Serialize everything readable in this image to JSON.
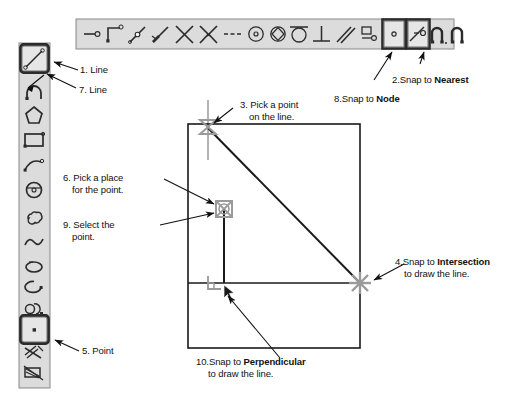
{
  "diagram": {
    "background": "#ffffff",
    "colors": {
      "toolbar_fill": "#d9d9d9",
      "toolbar_stroke": "#6b6b6b",
      "icon_stroke": "#2b2b2b",
      "selected_button_fill": "#e2e2e2",
      "selected_button_stroke": "#3a3a3a",
      "drawing_stroke": "#1a1a1a",
      "snap_marker": "#8a8a8a",
      "crosshair": "#9a9a9a",
      "arrow": "#111111",
      "text": "#111111"
    }
  },
  "top_toolbar": {
    "name": "snap-toolbar",
    "items": [
      {
        "id": "snap-endpoint",
        "icon": "line-endpoint-icon",
        "selected": false
      },
      {
        "id": "snap-corner",
        "icon": "corner-node-icon",
        "selected": false
      },
      {
        "id": "snap-midpoint",
        "icon": "midpoint-icon",
        "selected": false
      },
      {
        "id": "snap-end-of-line",
        "icon": "end-of-line-icon",
        "selected": false
      },
      {
        "id": "snap-intersection",
        "icon": "intersection-x-icon",
        "selected": false
      },
      {
        "id": "snap-apparent-intersection",
        "icon": "apparent-intersection-icon",
        "selected": false
      },
      {
        "id": "snap-extension",
        "icon": "extension-dashes-icon",
        "selected": false
      },
      {
        "id": "snap-center",
        "icon": "center-circle-icon",
        "selected": false
      },
      {
        "id": "snap-quadrant",
        "icon": "quadrant-icon",
        "selected": false
      },
      {
        "id": "snap-tangent",
        "icon": "tangent-icon",
        "selected": false
      },
      {
        "id": "snap-perpendicular",
        "icon": "perpendicular-icon",
        "selected": false
      },
      {
        "id": "snap-parallel",
        "icon": "parallel-icon",
        "selected": false
      },
      {
        "id": "snap-insert",
        "icon": "insert-icon",
        "selected": false
      },
      {
        "id": "snap-node",
        "icon": "node-dot-icon",
        "selected": true
      },
      {
        "id": "snap-nearest",
        "icon": "nearest-icon",
        "selected": true
      },
      {
        "id": "osnap-toggle",
        "icon": "magnet-icon",
        "selected": false
      },
      {
        "id": "osnap-settings",
        "icon": "magnet-settings-icon",
        "selected": false
      }
    ]
  },
  "left_toolbar": {
    "name": "draw-toolbar",
    "items": [
      {
        "id": "draw-line",
        "icon": "line-icon",
        "selected": true
      },
      {
        "id": "draw-polyline",
        "icon": "polyline-arc-icon",
        "selected": false
      },
      {
        "id": "draw-polygon",
        "icon": "polygon-icon",
        "selected": false
      },
      {
        "id": "draw-rectangle",
        "icon": "rectangle-icon",
        "selected": false
      },
      {
        "id": "draw-arc",
        "icon": "arc-icon",
        "selected": false
      },
      {
        "id": "draw-circle",
        "icon": "circle-icon",
        "selected": false
      },
      {
        "id": "draw-revcloud",
        "icon": "revision-cloud-icon",
        "selected": false
      },
      {
        "id": "draw-spline",
        "icon": "spline-icon",
        "selected": false
      },
      {
        "id": "draw-ellipse",
        "icon": "ellipse-icon",
        "selected": false
      },
      {
        "id": "draw-ellipse-arc",
        "icon": "ellipse-arc-icon",
        "selected": false
      },
      {
        "id": "draw-block",
        "icon": "insert-block-icon",
        "selected": false
      },
      {
        "id": "draw-make-block",
        "icon": "make-block-icon",
        "selected": false
      },
      {
        "id": "draw-point",
        "icon": "point-icon",
        "selected": true
      },
      {
        "id": "draw-hatch",
        "icon": "hatch-icon",
        "selected": false
      },
      {
        "id": "draw-gradient",
        "icon": "gradient-icon",
        "selected": false
      }
    ]
  },
  "callouts": [
    {
      "id": "callout-1",
      "number": "1.",
      "line1": "Line",
      "line2": "",
      "bold_word": "",
      "bold_tail": ""
    },
    {
      "id": "callout-7",
      "number": "7.",
      "line1": "Line",
      "line2": "",
      "bold_word": "",
      "bold_tail": ""
    },
    {
      "id": "callout-2",
      "number": "2.",
      "line1": "Snap to ",
      "bold_word": "Nearest",
      "line2": "",
      "bold_tail": ""
    },
    {
      "id": "callout-8",
      "number": "8.",
      "line1": "Snap to ",
      "bold_word": "Node",
      "line2": "",
      "bold_tail": ""
    },
    {
      "id": "callout-3",
      "number": "3.",
      "line1": "Pick a point",
      "line2": "on the line.",
      "bold_word": "",
      "bold_tail": ""
    },
    {
      "id": "callout-6",
      "number": "6.",
      "line1": "Pick a place",
      "line2": "for the point.",
      "bold_word": "",
      "bold_tail": ""
    },
    {
      "id": "callout-9",
      "number": "9.",
      "line1": "Select the",
      "line2": "point.",
      "bold_word": "",
      "bold_tail": ""
    },
    {
      "id": "callout-4",
      "number": "4.",
      "line1": "Snap to ",
      "bold_word": "Intersection",
      "line2": "to draw the line.",
      "bold_tail": ""
    },
    {
      "id": "callout-5",
      "number": "5.",
      "line1": "Point",
      "line2": "",
      "bold_word": "",
      "bold_tail": ""
    },
    {
      "id": "callout-10",
      "number": "10.",
      "line1": "Snap to ",
      "bold_word": "Perpendicular",
      "line2": "to draw the line.",
      "bold_tail": ""
    }
  ],
  "callout_text": {
    "c1_num": "1.",
    "c1_a": "Line",
    "c7_num": "7.",
    "c7_a": "Line",
    "c2_num": "2.",
    "c2_a": "Snap to ",
    "c2_b": "Nearest",
    "c8_num": "8.",
    "c8_a": "Snap to ",
    "c8_b": "Node",
    "c3_num": "3.",
    "c3_a": "Pick a point",
    "c3_b": "on the line.",
    "c6_num": "6.",
    "c6_a": "Pick a place",
    "c6_b": "for the point.",
    "c9_num": "9.",
    "c9_a": "Select the",
    "c9_b": "point.",
    "c4_num": "4.",
    "c4_a": "Snap to ",
    "c4_b": "Intersection",
    "c4_c": "to draw the line.",
    "c5_num": "5.",
    "c5_a": "Point",
    "c10_num": "10.",
    "c10_a": "Snap to ",
    "c10_b": "Perpendicular",
    "c10_c": "to draw the line."
  },
  "drawing": {
    "name": "cad-canvas",
    "rectangle": {
      "x": 188,
      "y": 124,
      "width": 172,
      "height": 224
    },
    "horizontal_divider_y": 283,
    "diagonal_line": {
      "x1": 208,
      "y1": 130,
      "x2": 360,
      "y2": 283
    },
    "vertical_line": {
      "x": 224,
      "y1": 209,
      "y2": 283
    },
    "markers": [
      {
        "id": "marker-nearest",
        "type": "nearest-snap-marker",
        "x": 208,
        "y": 127
      },
      {
        "id": "marker-node",
        "type": "node-snap-marker",
        "x": 224,
        "y": 208
      },
      {
        "id": "marker-intersection",
        "type": "intersection-snap-marker",
        "x": 360,
        "y": 283
      },
      {
        "id": "marker-perpendicular",
        "type": "perpendicular-snap-marker",
        "x": 215,
        "y": 281
      }
    ]
  }
}
